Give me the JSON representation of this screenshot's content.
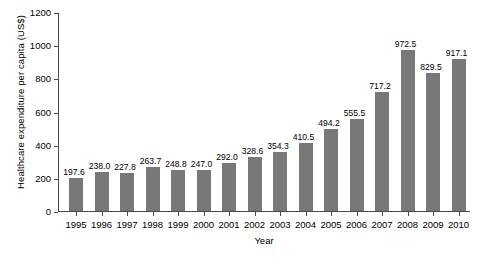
{
  "chart_data": {
    "type": "bar",
    "title": "",
    "xlabel": "Year",
    "ylabel": "Healthcare expenditure per capita (US$)",
    "categories": [
      "1995",
      "1996",
      "1997",
      "1998",
      "1999",
      "2000",
      "2001",
      "2002",
      "2003",
      "2004",
      "2005",
      "2006",
      "2007",
      "2008",
      "2009",
      "2010"
    ],
    "values": [
      197.6,
      238.0,
      227.8,
      263.7,
      248.8,
      247.0,
      292.0,
      328.6,
      354.3,
      410.5,
      494.2,
      555.5,
      717.2,
      972.5,
      829.5,
      917.1
    ],
    "value_labels": [
      "197.6",
      "238.0",
      "227.8",
      "263.7",
      "248.8",
      "247.0",
      "292.0",
      "328.6",
      "354.3",
      "410.5",
      "494.2",
      "555.5",
      "717.2",
      "972.5",
      "829.5",
      "917.1"
    ],
    "ylim": [
      0,
      1200
    ],
    "y_ticks": [
      0,
      200,
      400,
      600,
      800,
      1000,
      1200
    ],
    "y_tick_labels": [
      "0",
      "200",
      "400",
      "600",
      "800",
      "1000",
      "1200"
    ],
    "grid": false,
    "legend": null,
    "series": [
      {
        "name": "Healthcare expenditure per capita (US$)",
        "values": [
          197.6,
          238.0,
          227.8,
          263.7,
          248.8,
          247.0,
          292.0,
          328.6,
          354.3,
          410.5,
          494.2,
          555.5,
          717.2,
          972.5,
          829.5,
          917.1
        ],
        "color": "#787878"
      }
    ],
    "bar_color": "#787878",
    "axis_color": "#4a4a4a"
  }
}
